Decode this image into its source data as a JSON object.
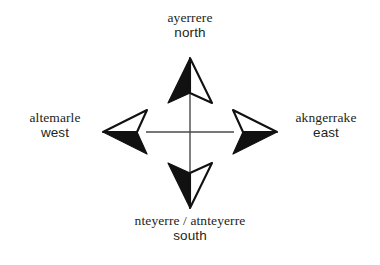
{
  "figure": {
    "name": "compass-rose-arrernte-directions",
    "background_color": "#ffffff",
    "ink_color": "#231f20",
    "crosshair_color": "#4a4a4a",
    "center": {
      "x": 190,
      "y": 132
    }
  },
  "directions": {
    "north": {
      "language_term": "ayerrere",
      "english_gloss": "north",
      "arrow_icon": "compass-arrow-north"
    },
    "south": {
      "language_term": "nteyerre / atnteyerre",
      "english_gloss": "south",
      "arrow_icon": "compass-arrow-south"
    },
    "west": {
      "language_term": "altemarle",
      "english_gloss": "west",
      "arrow_icon": "compass-arrow-west"
    },
    "east": {
      "language_term": "akngerrake",
      "english_gloss": "east",
      "arrow_icon": "compass-arrow-east"
    }
  }
}
